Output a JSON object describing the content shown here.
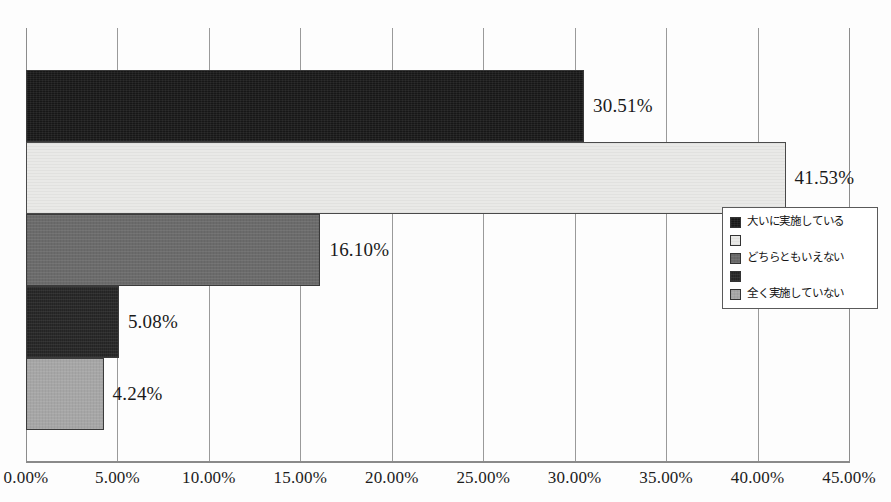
{
  "chart_data": {
    "type": "bar",
    "orientation": "horizontal",
    "title": "",
    "xlabel": "",
    "ylabel": "",
    "xlim": [
      0,
      45
    ],
    "grid": true,
    "legend_position": "right",
    "categories": [
      "大いに実施している",
      "",
      "どちらともいえない",
      "",
      "全く実施していない"
    ],
    "values": [
      30.51,
      41.53,
      16.1,
      5.08,
      4.24
    ],
    "value_labels": [
      "30.51%",
      "41.53%",
      "16.10%",
      "5.08%",
      "4.24%"
    ],
    "bar_fills": [
      "fill-black",
      "fill-white",
      "fill-midgray",
      "fill-dark",
      "fill-lightgray"
    ],
    "bar_colors": [
      "#171717",
      "#e9e9e7",
      "#6b6b6b",
      "#242424",
      "#a6a6a6"
    ],
    "xticks": [
      "0.00%",
      "5.00%",
      "10.00%",
      "15.00%",
      "20.00%",
      "25.00%",
      "30.00%",
      "35.00%",
      "40.00%",
      "45.00%"
    ],
    "xtick_values": [
      0,
      5,
      10,
      15,
      20,
      25,
      30,
      35,
      40,
      45
    ]
  },
  "legend": {
    "items": [
      {
        "label": "大いに実施している",
        "swatch": "fill-black"
      },
      {
        "label": "",
        "swatch": "fill-white"
      },
      {
        "label": "どちらともいえない",
        "swatch": "fill-midgray"
      },
      {
        "label": "",
        "swatch": "fill-dark"
      },
      {
        "label": "全く実施していない",
        "swatch": "fill-lightgray"
      }
    ]
  }
}
